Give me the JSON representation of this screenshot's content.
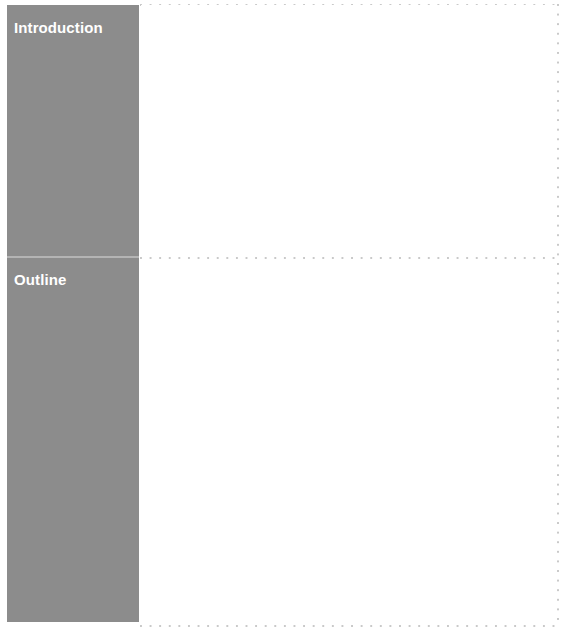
{
  "document": {
    "type": "presentation-section-outline",
    "background_color": "#ffffff"
  },
  "theme": {
    "rail_color": "#8c8c8c",
    "rail_divider_color": "#b4b4b4",
    "rail_text_color": "#ffffff",
    "guide_dot_color": "#c9c9c9",
    "content_background": "#ffffff"
  },
  "sections": [
    {
      "id": "introduction",
      "label": "Introduction",
      "content": ""
    },
    {
      "id": "outline",
      "label": "Outline",
      "content": ""
    }
  ],
  "guides": {
    "top_label": "top-dotted-rule",
    "middle_label": "middle-dotted-rule",
    "bottom_label": "bottom-dotted-rule",
    "right_label": "right-dotted-rule"
  }
}
